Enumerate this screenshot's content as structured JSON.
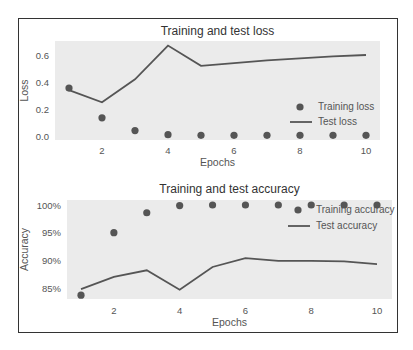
{
  "chart_data": [
    {
      "type": "line",
      "title": "Training and test loss",
      "xlabel": "Epochs",
      "ylabel": "Loss",
      "x": [
        1,
        2,
        3,
        4,
        5,
        6,
        7,
        8,
        9,
        10
      ],
      "xticks": [
        "2",
        "4",
        "6",
        "8",
        "10"
      ],
      "yticks": [
        "0.0",
        "0.2",
        "0.4",
        "0.6"
      ],
      "ylim": [
        0.0,
        0.7
      ],
      "grid": false,
      "legend_position": "lower right",
      "series": [
        {
          "name": "Training loss",
          "style": "markers",
          "values": [
            0.355,
            0.135,
            0.04,
            0.01,
            0.005,
            0.005,
            0.005,
            0.005,
            0.005,
            0.005
          ]
        },
        {
          "name": "Test loss",
          "style": "line",
          "values": [
            0.34,
            0.25,
            0.42,
            0.67,
            0.52,
            0.54,
            0.56,
            0.575,
            0.59,
            0.6
          ]
        }
      ]
    },
    {
      "type": "line",
      "title": "Training and test accuracy",
      "xlabel": "Epochs",
      "ylabel": "Accuracy",
      "x": [
        1,
        2,
        3,
        4,
        5,
        6,
        7,
        8,
        9,
        10
      ],
      "xticks": [
        "2",
        "4",
        "6",
        "8",
        "10"
      ],
      "yticks": [
        "85%",
        "90%",
        "95%",
        "100%"
      ],
      "ylim": [
        83.0,
        100.5
      ],
      "grid": false,
      "legend_position": "upper right",
      "series": [
        {
          "name": "Training accuracy",
          "style": "markers",
          "values": [
            83.7,
            95.0,
            98.6,
            99.9,
            100.0,
            100.0,
            100.0,
            100.0,
            100.0,
            100.0
          ]
        },
        {
          "name": "Test accuracy",
          "style": "line",
          "values": [
            84.8,
            87.0,
            88.2,
            84.7,
            88.8,
            90.4,
            89.9,
            89.9,
            89.8,
            89.3
          ]
        }
      ]
    }
  ],
  "colors": {
    "plot_background": "#ebebeb",
    "series_color": "#555555",
    "frame": "#333333"
  }
}
